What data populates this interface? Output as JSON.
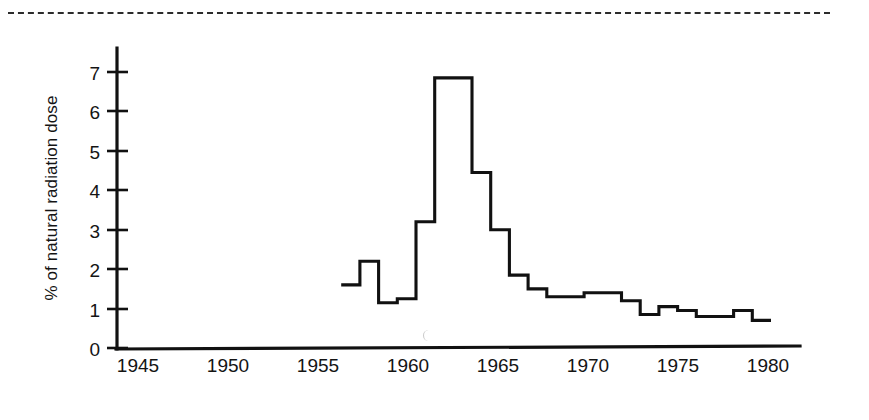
{
  "figure": {
    "name": "fallout-radiation-dose-step-chart",
    "page_rule_style": "dashed"
  },
  "axes": {
    "y_title": "% of natural radiation dose",
    "y_ticks": [
      "0",
      "1",
      "2",
      "3",
      "4",
      "5",
      "6",
      "7"
    ],
    "x_ticks": [
      "1945",
      "1950",
      "1955",
      "1960",
      "1965",
      "1970",
      "1975",
      "1980"
    ]
  },
  "chart_data": {
    "type": "line",
    "title": "",
    "xlabel": "",
    "ylabel": "% of natural radiation dose",
    "xlim": [
      1945,
      1980
    ],
    "ylim": [
      0,
      7.6
    ],
    "grid": false,
    "legend": null,
    "step": "post",
    "x": [
      1957,
      1958,
      1959,
      1960,
      1961,
      1962,
      1963,
      1964,
      1965,
      1966,
      1967,
      1968,
      1969,
      1970,
      1971,
      1972,
      1973,
      1974,
      1975,
      1976,
      1977,
      1978,
      1979
    ],
    "values": [
      1.6,
      2.2,
      1.15,
      1.25,
      3.2,
      6.85,
      6.85,
      4.45,
      3.0,
      1.85,
      1.5,
      1.3,
      1.3,
      1.4,
      1.4,
      1.2,
      0.85,
      1.05,
      0.95,
      0.8,
      0.8,
      0.95,
      0.7
    ],
    "series": [
      {
        "name": "% of natural radiation dose",
        "values": [
          1.6,
          2.2,
          1.15,
          1.25,
          3.2,
          6.85,
          6.85,
          4.45,
          3.0,
          1.85,
          1.5,
          1.3,
          1.3,
          1.4,
          1.4,
          1.2,
          0.85,
          1.05,
          0.95,
          0.8,
          0.8,
          0.95,
          0.7
        ]
      }
    ],
    "peak": {
      "year": 1963,
      "value": 6.85
    },
    "ytick_values": [
      0,
      1,
      2,
      3,
      4,
      5,
      6,
      7
    ],
    "xtick_values": [
      1945,
      1950,
      1955,
      1960,
      1965,
      1970,
      1975,
      1980
    ],
    "line_color": "#111111"
  }
}
